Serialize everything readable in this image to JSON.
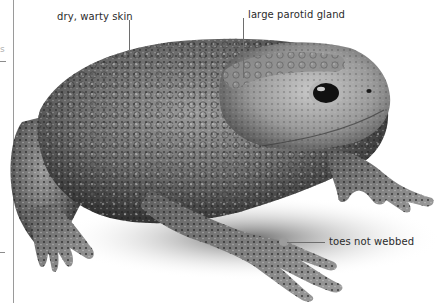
{
  "figure": {
    "labels": [
      {
        "id": "skin",
        "text": "dry, warty skin"
      },
      {
        "id": "gland",
        "text": "large parotid gland"
      },
      {
        "id": "toes",
        "text": "toes not webbed"
      }
    ]
  },
  "margin": {
    "partial_glyph": "s"
  },
  "colors": {
    "background": "#ffffff",
    "label_text": "#2b2b2b",
    "leader_line": "#6e6e6e",
    "margin_rule": "#9a9a9a"
  }
}
